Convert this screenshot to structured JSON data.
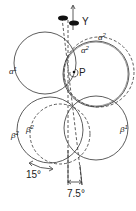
{
  "labels": {
    "y_axis": "Y",
    "pivot": "P",
    "alpha1": "α",
    "alpha1_sup": "1",
    "alpha2_outer": "α",
    "alpha2_outer_sup": "2",
    "alpha2_inner": "α",
    "alpha2_inner_sup": "2",
    "beta2_outer": "β",
    "beta2_outer_sup": "2",
    "beta2_inner": "β",
    "beta2_inner_sup": "2",
    "beta1": "β",
    "beta1_sup": "1",
    "rotation_angle": "15°",
    "tilt_angle": "7.5°"
  },
  "colors": {
    "line": "#333333",
    "background": "#ffffff",
    "marker": "#111111"
  }
}
